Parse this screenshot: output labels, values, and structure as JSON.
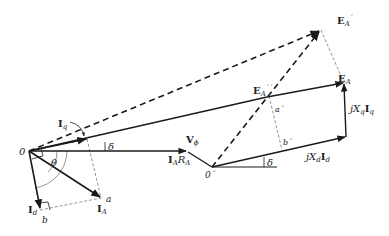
{
  "diagram": {
    "labels": {
      "origin": "0",
      "origin_prime": "0´",
      "v_phi": "V",
      "v_phi_sub": "ϕ",
      "iq": "I",
      "iq_sub": "q",
      "id": "I",
      "id_sub": "d",
      "ia": "I",
      "ia_sub": "A",
      "iara_I": "I",
      "iara_A": "A",
      "iara_R": "R",
      "iara_RA": "A",
      "theta": "θ",
      "delta_top": "δ",
      "delta_bottom": "δ",
      "point_a": "a",
      "point_b": "b",
      "point_a_prime": "a´",
      "point_b_prime": "b´",
      "ea": "E",
      "ea_sub": "A",
      "ea_prime": "E",
      "ea_prime_sub": "A",
      "ea_prime_mark": "´",
      "ea_dprime": "E",
      "ea_dprime_sub": "A",
      "ea_dprime_mark": "´´",
      "jxqiq_j": "jX",
      "jxqiq_q": "q",
      "jxqiq_I": "I",
      "jxqiq_q2": "q",
      "jxdid_j": "jX",
      "jxdid_d": "d",
      "jxdid_I": "I",
      "jxdid_d2": "d"
    },
    "colors": {
      "line": "#1a1a1a",
      "construction": "#777777",
      "arc": "#999999"
    }
  }
}
